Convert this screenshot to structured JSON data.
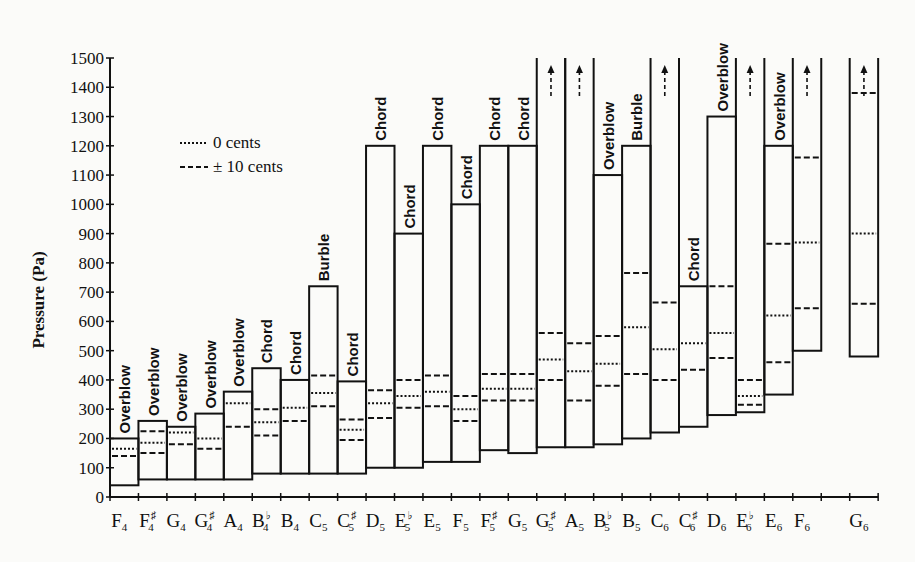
{
  "chart_data": {
    "type": "bar",
    "subtype": "floating-range",
    "title": "",
    "xlabel": "",
    "ylabel": "Pressure (Pa)",
    "ylim": [
      0,
      1500
    ],
    "yticks": [
      0,
      100,
      200,
      300,
      400,
      500,
      600,
      700,
      800,
      900,
      1000,
      1100,
      1200,
      1300,
      1400,
      1500
    ],
    "grid": false,
    "legend": {
      "position": "upper-left",
      "entries": [
        {
          "style": "dotted",
          "label": "0 cents"
        },
        {
          "style": "dashed",
          "label": "± 10 cents"
        }
      ]
    },
    "categories": [
      "F4",
      "F#4",
      "G4",
      "G#4",
      "A4",
      "Bb4",
      "B4",
      "C5",
      "C#5",
      "D5",
      "Eb5",
      "E5",
      "F5",
      "F#5",
      "G5",
      "G#5",
      "A5",
      "Bb5",
      "B5",
      "C6",
      "C#6",
      "D6",
      "Eb6",
      "E6",
      "F6",
      "G6"
    ],
    "notes": [
      {
        "name": "F",
        "acc": "",
        "oct": "4",
        "slot": 0,
        "min": 40,
        "max": 200,
        "upper_label": "Overblow",
        "dotted": [
          165
        ],
        "dashed": [
          140
        ]
      },
      {
        "name": "F",
        "acc": "♯",
        "oct": "4",
        "slot": 1,
        "min": 60,
        "max": 260,
        "upper_label": "Overblow",
        "dotted": [
          185
        ],
        "dashed": [
          150,
          225
        ]
      },
      {
        "name": "G",
        "acc": "",
        "oct": "4",
        "slot": 2,
        "min": 60,
        "max": 240,
        "upper_label": "Overblow",
        "dotted": [
          220
        ],
        "dashed": [
          180
        ]
      },
      {
        "name": "G",
        "acc": "♯",
        "oct": "4",
        "slot": 3,
        "min": 60,
        "max": 285,
        "upper_label": "Overblow",
        "dotted": [
          200
        ],
        "dashed": [
          165
        ]
      },
      {
        "name": "A",
        "acc": "",
        "oct": "4",
        "slot": 4,
        "min": 60,
        "max": 360,
        "upper_label": "Overblow",
        "dotted": [
          320
        ],
        "dashed": [
          240
        ]
      },
      {
        "name": "B",
        "acc": "♭",
        "oct": "4",
        "slot": 5,
        "min": 80,
        "max": 440,
        "upper_label": "Chord",
        "dotted": [
          255
        ],
        "dashed": [
          210,
          300
        ]
      },
      {
        "name": "B",
        "acc": "",
        "oct": "4",
        "slot": 6,
        "min": 80,
        "max": 400,
        "upper_label": "Chord",
        "dotted": [
          305
        ],
        "dashed": [
          260
        ]
      },
      {
        "name": "C",
        "acc": "",
        "oct": "5",
        "slot": 7,
        "min": 80,
        "max": 720,
        "upper_label": "Burble",
        "dotted": [
          355
        ],
        "dashed": [
          310,
          415
        ]
      },
      {
        "name": "C",
        "acc": "♯",
        "oct": "5",
        "slot": 8,
        "min": 80,
        "max": 395,
        "upper_label": "Chord",
        "dotted": [
          230
        ],
        "dashed": [
          195,
          265
        ]
      },
      {
        "name": "D",
        "acc": "",
        "oct": "5",
        "slot": 9,
        "min": 100,
        "max": 1200,
        "upper_label": "Chord",
        "dotted": [
          320
        ],
        "dashed": [
          270,
          365
        ]
      },
      {
        "name": "E",
        "acc": "♭",
        "oct": "5",
        "slot": 10,
        "min": 100,
        "max": 900,
        "upper_label": "Chord",
        "dotted": [
          345
        ],
        "dashed": [
          305,
          400
        ]
      },
      {
        "name": "E",
        "acc": "",
        "oct": "5",
        "slot": 11,
        "min": 120,
        "max": 1200,
        "upper_label": "Chord",
        "dotted": [
          360
        ],
        "dashed": [
          310,
          415
        ]
      },
      {
        "name": "F",
        "acc": "",
        "oct": "5",
        "slot": 12,
        "min": 120,
        "max": 1000,
        "upper_label": "Chord",
        "dotted": [
          300
        ],
        "dashed": [
          260,
          345
        ]
      },
      {
        "name": "F",
        "acc": "♯",
        "oct": "5",
        "slot": 13,
        "min": 160,
        "max": 1200,
        "upper_label": "Chord",
        "dotted": [
          370
        ],
        "dashed": [
          330,
          420
        ]
      },
      {
        "name": "G",
        "acc": "",
        "oct": "5",
        "slot": 14,
        "min": 150,
        "max": 1200,
        "upper_label": "Chord",
        "dotted": [
          370
        ],
        "dashed": [
          330,
          420
        ]
      },
      {
        "name": "G",
        "acc": "♯",
        "oct": "5",
        "slot": 15,
        "min": 170,
        "max": 1500,
        "upper_label": "",
        "open_top": true,
        "dotted": [
          470
        ],
        "dashed": [
          400,
          560
        ]
      },
      {
        "name": "A",
        "acc": "",
        "oct": "5",
        "slot": 16,
        "min": 170,
        "max": 1500,
        "upper_label": "",
        "open_top": true,
        "dotted": [
          430
        ],
        "dashed": [
          330,
          525
        ]
      },
      {
        "name": "B",
        "acc": "♭",
        "oct": "5",
        "slot": 17,
        "min": 180,
        "max": 1100,
        "upper_label": "Overblow",
        "dotted": [
          455
        ],
        "dashed": [
          380,
          550
        ]
      },
      {
        "name": "B",
        "acc": "",
        "oct": "5",
        "slot": 18,
        "min": 200,
        "max": 1200,
        "upper_label": "Burble",
        "dotted": [
          580
        ],
        "dashed": [
          420,
          765
        ]
      },
      {
        "name": "C",
        "acc": "",
        "oct": "6",
        "slot": 19,
        "min": 220,
        "max": 1500,
        "upper_label": "",
        "open_top": true,
        "dotted": [
          505
        ],
        "dashed": [
          400,
          665
        ]
      },
      {
        "name": "C",
        "acc": "♯",
        "oct": "6",
        "slot": 20,
        "min": 240,
        "max": 720,
        "upper_label": "Chord",
        "dotted": [
          525
        ],
        "dashed": [
          435
        ]
      },
      {
        "name": "D",
        "acc": "",
        "oct": "6",
        "slot": 21,
        "min": 280,
        "max": 1300,
        "upper_label": "Overblow",
        "dotted": [
          560
        ],
        "dashed": [
          475,
          720
        ]
      },
      {
        "name": "E",
        "acc": "♭",
        "oct": "6",
        "slot": 22,
        "min": 290,
        "max": 1500,
        "upper_label": "",
        "open_top": true,
        "dotted": [
          345
        ],
        "dashed": [
          315,
          400
        ]
      },
      {
        "name": "E",
        "acc": "",
        "oct": "6",
        "slot": 23,
        "min": 350,
        "max": 1200,
        "upper_label": "Overblow",
        "dotted": [
          620
        ],
        "dashed": [
          460,
          865
        ]
      },
      {
        "name": "F",
        "acc": "",
        "oct": "6",
        "slot": 24,
        "min": 500,
        "max": 1500,
        "upper_label": "",
        "open_top": true,
        "dotted": [
          870
        ],
        "dashed": [
          645,
          1160
        ]
      },
      {
        "name": "G",
        "acc": "",
        "oct": "6",
        "slot": 26,
        "min": 480,
        "max": 1500,
        "upper_label": "",
        "open_top": true,
        "dotted": [
          900
        ],
        "dashed": [
          660,
          1380
        ]
      }
    ]
  }
}
